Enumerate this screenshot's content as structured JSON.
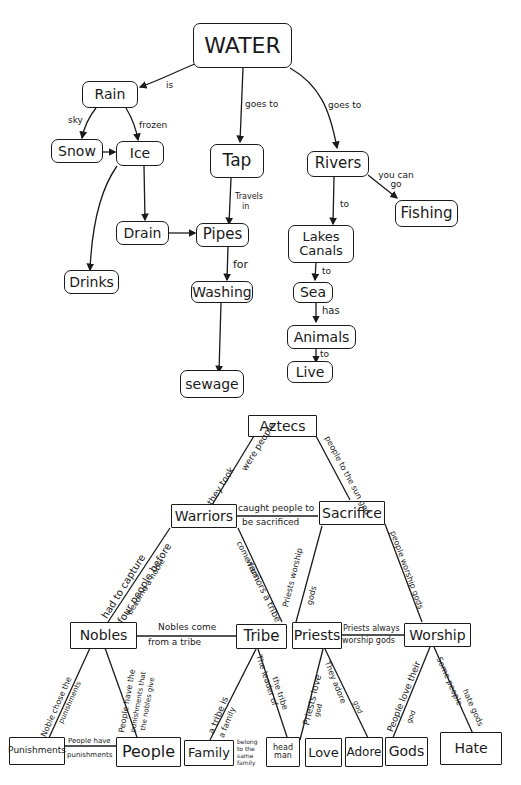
{
  "water_map": {
    "root": "WATER",
    "nodes": {
      "rain": "Rain",
      "snow": "Snow",
      "ice": "Ice",
      "tap": "Tap",
      "rivers": "Rivers",
      "fishing": "Fishing",
      "drain": "Drain",
      "pipes": "Pipes",
      "drinks": "Drinks",
      "washing": "Washing",
      "sewage": "sewage",
      "lakes_canals_1": "Lakes",
      "lakes_canals_2": "Canals",
      "sea": "Sea",
      "animals": "Animals",
      "live": "Live"
    },
    "links": {
      "water_rain": "is",
      "water_tap": "goes to",
      "water_rivers": "goes to",
      "rain_snow": "sky",
      "rain_ice": "frozen",
      "rivers_fishing": "you can go",
      "tap_pipes_1": "Travels",
      "tap_pipes_2": "in",
      "pipes_washing": "for",
      "rivers_lakes": "to",
      "lakes_sea": "to",
      "sea_animals": "has",
      "animals_live": "to"
    }
  },
  "aztec_map": {
    "root": "Aztecs",
    "nodes": {
      "warriors": "Warriors",
      "sacrifice": "Sacrifice",
      "nobles": "Nobles",
      "tribe": "Tribe",
      "priests": "Priests",
      "worship": "Worship",
      "punishments": "Punishments",
      "people": "People",
      "family": "Family",
      "head_man_1": "head",
      "head_man_2": "man",
      "love": "Love",
      "adore": "Adore",
      "gods": "Gods",
      "hate": "Hate"
    },
    "links": {
      "aztecs_warriors_a": "were people",
      "aztecs_warriors_b": "they took",
      "aztecs_sacrifice": "people to the sun god",
      "warriors_sacrifice_1": "caught people to",
      "warriors_sacrifice_2": "be sacrificed",
      "warriors_nobles_a": "had to capture",
      "warriors_nobles_b": "four people before",
      "warriors_nobles_c": "become a noble",
      "warriors_tribe_a": "come from",
      "warriors_tribe_b": "warriors a tribe",
      "sacrifice_priests_a": "Priests worship",
      "sacrifice_priests_b": "gods",
      "sacrifice_worship": "people worship gods",
      "nobles_tribe_1": "Nobles come",
      "nobles_tribe_2": "from a tribe",
      "priests_worship_1": "Priests always",
      "priests_worship_2": "worship gods",
      "nobles_punishments_a": "Noble chose the",
      "nobles_punishments_b": "punishments",
      "nobles_people_a": "People have the",
      "nobles_people_b": "punishments that",
      "nobles_people_c": "the nobles give",
      "punishments_people_1": "People have",
      "punishments_people_2": "punishments",
      "tribe_family_a": "a tribe is",
      "tribe_family_b": "a family",
      "tribe_headman_a": "The leader of",
      "tribe_headman_b": "the tribe",
      "family_headman_1": "belong",
      "family_headman_2": "to the",
      "family_headman_3": "same",
      "family_headman_4": "family",
      "priests_love_a": "Priests love",
      "priests_love_b": "god",
      "priests_adore_a": "They adore",
      "priests_adore_b": "god",
      "worship_gods_a": "People love their",
      "worship_gods_b": "god",
      "worship_hate_a": "Some people",
      "worship_hate_b": "hate gods"
    }
  }
}
